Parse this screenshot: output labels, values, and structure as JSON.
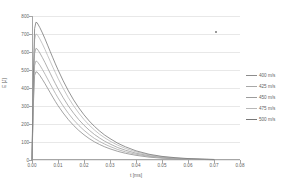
{
  "chart_data": {
    "type": "line",
    "title": "",
    "xlabel": "t [ms]",
    "ylabel": "E [J]",
    "xlim": [
      0.0,
      0.08
    ],
    "ylim": [
      0,
      800
    ],
    "grid": "horizontal",
    "legend_position": "right",
    "xticks": [
      "0.00",
      "0.01",
      "0.02",
      "0.03",
      "0.04",
      "0.05",
      "0.06",
      "0.07",
      "0.08"
    ],
    "xtick_values": [
      0.0,
      0.01,
      0.02,
      0.03,
      0.04,
      0.05,
      0.06,
      0.07,
      0.08
    ],
    "yticks": [
      "0",
      "100",
      "200",
      "300",
      "400",
      "500",
      "600",
      "700",
      "800"
    ],
    "ytick_values": [
      0,
      100,
      200,
      300,
      400,
      500,
      600,
      700,
      800
    ],
    "x": [
      0.0,
      0.0005,
      0.001,
      0.0015,
      0.002,
      0.003,
      0.004,
      0.005,
      0.006,
      0.007,
      0.008,
      0.009,
      0.01,
      0.012,
      0.014,
      0.016,
      0.018,
      0.02,
      0.022,
      0.024,
      0.026,
      0.028,
      0.03,
      0.033,
      0.036,
      0.04,
      0.045,
      0.05,
      0.055,
      0.06,
      0.065,
      0.07
    ],
    "series": [
      {
        "name": "400 m/s",
        "color": "#8c8c8c",
        "peak": 490,
        "values": [
          0,
          300,
          470,
          490,
          488,
          470,
          448,
          424,
          399,
          374,
          349,
          325,
          302,
          261,
          224,
          192,
          164,
          140,
          119,
          101,
          86,
          73,
          62,
          48,
          37,
          26,
          16,
          10,
          7,
          4,
          3,
          2
        ]
      },
      {
        "name": "425 m/s",
        "color": "#a8a8a8",
        "peak": 550,
        "values": [
          0,
          330,
          525,
          550,
          547,
          527,
          503,
          477,
          450,
          423,
          396,
          370,
          345,
          300,
          259,
          223,
          192,
          165,
          141,
          120,
          103,
          88,
          75,
          58,
          45,
          32,
          20,
          13,
          8,
          5,
          3,
          2
        ]
      },
      {
        "name": "450 m/s",
        "color": "#9c9c9c",
        "peak": 620,
        "values": [
          0,
          370,
          592,
          620,
          617,
          595,
          569,
          541,
          511,
          482,
          452,
          424,
          396,
          346,
          300,
          260,
          224,
          193,
          166,
          142,
          122,
          104,
          89,
          69,
          54,
          38,
          24,
          15,
          10,
          6,
          4,
          2
        ]
      },
      {
        "name": "475 m/s",
        "color": "#b8b8b8",
        "peak": 700,
        "values": [
          0,
          415,
          668,
          700,
          697,
          673,
          645,
          614,
          581,
          549,
          516,
          485,
          454,
          398,
          346,
          301,
          261,
          225,
          194,
          167,
          143,
          123,
          105,
          82,
          64,
          45,
          28,
          18,
          11,
          7,
          5,
          3
        ]
      },
      {
        "name": "500 m/s",
        "color": "#787878",
        "peak": 765,
        "values": [
          0,
          450,
          730,
          765,
          762,
          736,
          706,
          673,
          638,
          603,
          568,
          534,
          501,
          440,
          384,
          334,
          290,
          251,
          217,
          187,
          161,
          138,
          119,
          93,
          73,
          51,
          32,
          20,
          13,
          8,
          5,
          3
        ]
      }
    ]
  },
  "axes": {
    "x_title": "t [ms]",
    "y_title": "E [J]"
  },
  "legend": {
    "items": [
      {
        "label": "400 m/s"
      },
      {
        "label": "425 m/s"
      },
      {
        "label": "450 m/s"
      },
      {
        "label": "475 m/s"
      },
      {
        "label": "500 m/s"
      }
    ]
  }
}
